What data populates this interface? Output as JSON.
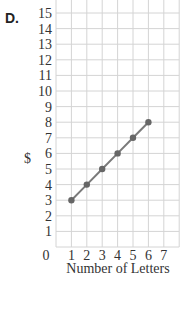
{
  "figure_label": "D.",
  "chart_data": {
    "type": "line",
    "title": "",
    "xlabel": "Number of Letters",
    "ylabel": "$",
    "x": [
      1,
      2,
      3,
      4,
      5,
      6
    ],
    "values": [
      3,
      4,
      5,
      6,
      7,
      8
    ],
    "series": [
      {
        "name": "",
        "x": [
          1,
          2,
          3,
          4,
          5,
          6
        ],
        "values": [
          3,
          4,
          5,
          6,
          7,
          8
        ]
      }
    ],
    "xticks": [
      "0",
      "1",
      "2",
      "3",
      "4",
      "5",
      "6",
      "7"
    ],
    "yticks": [
      "1",
      "2",
      "3",
      "4",
      "5",
      "6",
      "7",
      "8",
      "9",
      "10",
      "11",
      "12",
      "13",
      "14",
      "15"
    ],
    "xlim": [
      0,
      8
    ],
    "ylim": [
      0,
      16
    ],
    "grid": true,
    "legend": "none",
    "colors": {
      "line": "#7a7a7a",
      "marker": "#666666",
      "grid": "#d4d4d4",
      "text": "#333333"
    }
  }
}
